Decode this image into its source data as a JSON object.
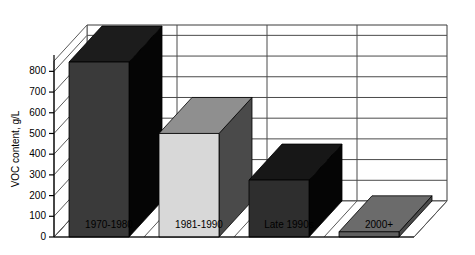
{
  "chart_data": {
    "type": "bar",
    "title": "",
    "subtitle": "",
    "xlabel": "",
    "ylabel": "VOC content, g/L",
    "categories": [
      "1970-1980",
      "1981-1990",
      "Late 1990s",
      "2000+"
    ],
    "values": [
      845,
      500,
      275,
      25
    ],
    "series": [
      {
        "name": "VOC content",
        "values": [
          845,
          500,
          275,
          25
        ]
      }
    ],
    "ylim": [
      0,
      850
    ],
    "y_ticks": [
      0,
      100,
      200,
      300,
      400,
      500,
      600,
      700,
      800
    ],
    "y_tick_labels": [
      "0",
      "100",
      "200",
      "300",
      "400",
      "500",
      "600",
      "700",
      "800"
    ],
    "grid": true,
    "grid_axis": "y",
    "legend": false,
    "legend_position": "none",
    "projection": "3d-oblique",
    "bar_colors": [
      "#3a3a3a",
      "#d8d8d8",
      "#2e2e2e",
      "#606060"
    ],
    "bar_top_colors": [
      "#1c1c1c",
      "#8f8f8f",
      "#171717",
      "#6b6b6b"
    ],
    "bar_side_colors": [
      "#050505",
      "#4a4a4a",
      "#050505",
      "#4a4a4a"
    ],
    "annotations": []
  },
  "axes": {
    "y_axis_title": "VOC content, g/L"
  },
  "colors": {
    "background": "#ffffff",
    "wall": "#4a4a4a",
    "floor": "#5a5a5a",
    "axis": "#000000",
    "text": "#000000"
  }
}
